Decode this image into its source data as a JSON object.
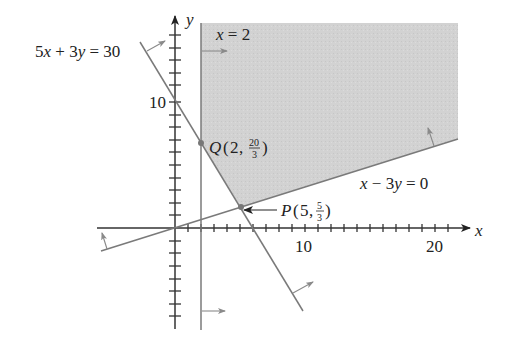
{
  "figure": {
    "type": "linear-programming feasible region",
    "axes": {
      "x_label": "x",
      "y_label": "y",
      "x_tick_labels": [
        "10",
        "20"
      ],
      "y_tick_labels": [
        "10"
      ],
      "x_range": [
        -6,
        22
      ],
      "y_range": [
        -8,
        16
      ]
    },
    "constraints": [
      {
        "id": "c1",
        "label": "5x + 3y = 30",
        "label_parts": [
          "5",
          "x",
          " + 3",
          "y",
          " = 30"
        ]
      },
      {
        "id": "c2",
        "label": "x = 2",
        "label_parts": [
          "x",
          " = 2"
        ]
      },
      {
        "id": "c3",
        "label": "x − 3y = 0",
        "label_parts": [
          "x",
          " − 3",
          "y",
          " = 0"
        ]
      }
    ],
    "vertices": [
      {
        "name": "Q",
        "x": "2",
        "y_num": "20",
        "y_den": "3",
        "text": "Q(2, 20/3)"
      },
      {
        "name": "P",
        "x": "5",
        "y_num": "5",
        "y_den": "3",
        "text": "P(5, 5/3)"
      }
    ],
    "region": {
      "fill": "#d2d2d2",
      "description": "unbounded feasible region shaded"
    },
    "colors": {
      "shade": "#d2d2d2",
      "lines": "#7a7a7a",
      "axes": "#333333",
      "arrows": "#8a8a8a"
    }
  }
}
